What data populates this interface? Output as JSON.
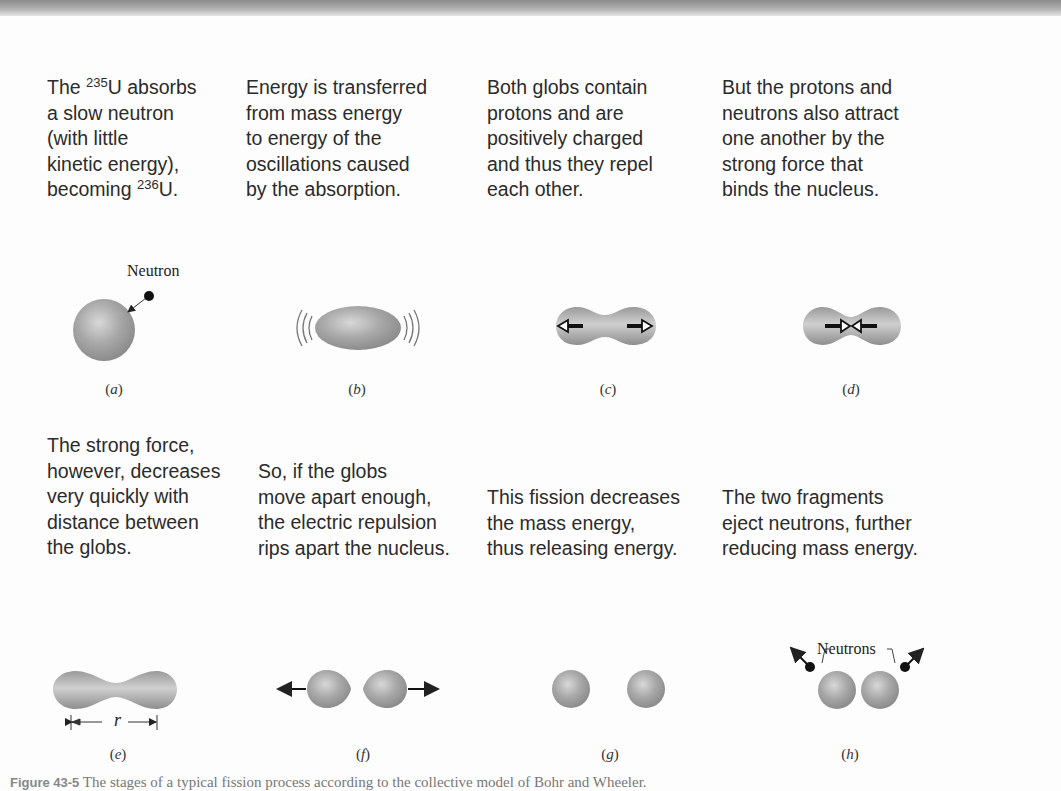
{
  "figure": {
    "panels": [
      {
        "id": "a",
        "label": "a",
        "text_before": "The ",
        "sup1": "235",
        "text_mid": "U absorbs\na slow neutron\n(with little\nkinetic energy),\nbecoming ",
        "sup2": "236",
        "text_after": "U.",
        "annotation": "Neutron"
      },
      {
        "id": "b",
        "label": "b",
        "text": "Energy is transferred\nfrom mass energy\nto energy of the\noscillations caused\nby the absorption."
      },
      {
        "id": "c",
        "label": "c",
        "text": "Both globs contain\nprotons and are\npositively charged\nand thus they repel\neach other."
      },
      {
        "id": "d",
        "label": "d",
        "text": "But the protons and\nneutrons also attract\none another by the\nstrong force that\nbinds the nucleus."
      },
      {
        "id": "e",
        "label": "e",
        "text": "The strong force,\nhowever, decreases\nvery quickly with\ndistance between\nthe globs.",
        "annotation": "r"
      },
      {
        "id": "f",
        "label": "f",
        "text": "So, if the globs\nmove apart enough,\nthe electric repulsion\nrips apart the nucleus."
      },
      {
        "id": "g",
        "label": "g",
        "text": "This fission decreases\nthe mass energy,\nthus releasing energy."
      },
      {
        "id": "h",
        "label": "h",
        "text": "The two fragments\neject neutrons, further\nreducing mass energy.",
        "annotation": "Neutrons"
      }
    ],
    "caption_number": "Figure 43-5",
    "caption_text": " The stages of a typical fission process according to the collective model of Bohr and Wheeler."
  },
  "colors": {
    "nucleus": "#9a9a9a",
    "nucleus_highlight": "#d4d4d4",
    "text": "#2b2b2b"
  }
}
